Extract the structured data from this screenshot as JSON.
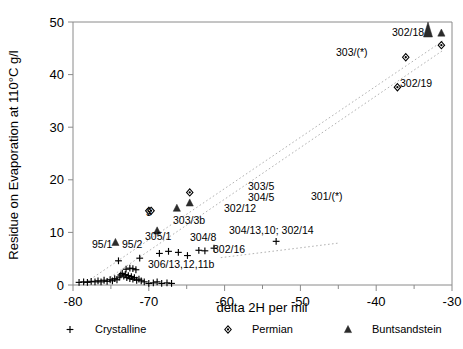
{
  "chart_data": {
    "type": "scatter",
    "title": "",
    "xlabel": "delta 2H  per mil",
    "ylabel": "Residue on Evaporation at 110°C  g/l",
    "xlim": [
      -80,
      -30
    ],
    "ylim": [
      0,
      50
    ],
    "xticks": [
      -80,
      -70,
      -60,
      -50,
      -40,
      -30
    ],
    "yticks": [
      0,
      10,
      20,
      30,
      40,
      50
    ],
    "xtick_labels": [
      "-80",
      "-70",
      "-60",
      "-50",
      "-40",
      "-30"
    ],
    "ytick_labels": [
      "0",
      "10",
      "20",
      "30",
      "40",
      "50"
    ],
    "xminor_step": 5,
    "grid": false,
    "legend_position": "below-axis",
    "legend": [
      {
        "label": "Crystalline",
        "marker": "plus"
      },
      {
        "label": "Permian",
        "marker": "diamond"
      },
      {
        "label": "Buntsandstein",
        "marker": "triangle"
      }
    ],
    "series": [
      {
        "name": "Crystalline",
        "marker": "plus",
        "points": [
          {
            "x": -79.2,
            "y": 0.5
          },
          {
            "x": -78.6,
            "y": 0.6
          },
          {
            "x": -78.1,
            "y": 0.5
          },
          {
            "x": -77.6,
            "y": 0.7
          },
          {
            "x": -77.1,
            "y": 0.6
          },
          {
            "x": -76.7,
            "y": 0.8
          },
          {
            "x": -76.3,
            "y": 0.6
          },
          {
            "x": -75.9,
            "y": 0.9
          },
          {
            "x": -75.5,
            "y": 0.7
          },
          {
            "x": -75.1,
            "y": 1.0
          },
          {
            "x": -74.8,
            "y": 0.8
          },
          {
            "x": -74.5,
            "y": 1.2
          },
          {
            "x": -74.2,
            "y": 1.0
          },
          {
            "x": -73.9,
            "y": 1.5
          },
          {
            "x": -73.7,
            "y": 1.9
          },
          {
            "x": -73.5,
            "y": 2.2
          },
          {
            "x": -73.3,
            "y": 1.7
          },
          {
            "x": -73.1,
            "y": 2.0
          },
          {
            "x": -72.9,
            "y": 1.4
          },
          {
            "x": -72.7,
            "y": 1.8
          },
          {
            "x": -72.5,
            "y": 1.2
          },
          {
            "x": -72.3,
            "y": 1.6
          },
          {
            "x": -72.1,
            "y": 1.1
          },
          {
            "x": -71.9,
            "y": 1.4
          },
          {
            "x": -71.6,
            "y": 0.9
          },
          {
            "x": -71.3,
            "y": 1.1
          },
          {
            "x": -71.0,
            "y": 0.8
          },
          {
            "x": -70.6,
            "y": 0.6
          },
          {
            "x": -70.0,
            "y": 0.3
          },
          {
            "x": -69.4,
            "y": 0.4
          },
          {
            "x": -68.9,
            "y": 0.6
          },
          {
            "x": -68.3,
            "y": 0.3
          },
          {
            "x": -67.6,
            "y": 0.4
          },
          {
            "x": -67.0,
            "y": 0.3
          },
          {
            "x": -73.0,
            "y": 3.0
          },
          {
            "x": -72.5,
            "y": 3.2
          },
          {
            "x": -72.1,
            "y": 3.1
          },
          {
            "x": -71.7,
            "y": 2.9
          },
          {
            "x": -74.0,
            "y": 4.6
          },
          {
            "x": -71.2,
            "y": 5.1
          },
          {
            "x": -68.6,
            "y": 6.0
          },
          {
            "x": -67.4,
            "y": 6.4
          },
          {
            "x": -66.1,
            "y": 6.2
          },
          {
            "x": -64.9,
            "y": 5.6
          },
          {
            "x": -63.4,
            "y": 6.6
          },
          {
            "x": -62.6,
            "y": 6.5
          },
          {
            "x": -61.4,
            "y": 7.0
          },
          {
            "x": -53.2,
            "y": 8.3
          }
        ]
      },
      {
        "name": "Permian",
        "marker": "diamond",
        "points": [
          {
            "x": -64.6,
            "y": 17.6
          },
          {
            "x": -70.0,
            "y": 14.1
          },
          {
            "x": -69.7,
            "y": 14.1
          },
          {
            "x": -36.1,
            "y": 43.3
          },
          {
            "x": -37.2,
            "y": 37.6
          },
          {
            "x": -31.4,
            "y": 45.6
          }
        ]
      },
      {
        "name": "Buntsandstein",
        "marker": "triangle",
        "points": [
          {
            "x": -64.6,
            "y": 15.6
          },
          {
            "x": -66.3,
            "y": 14.6
          },
          {
            "x": -68.9,
            "y": 10.3
          },
          {
            "x": -74.4,
            "y": 8.1
          },
          {
            "x": -31.4,
            "y": 47.9
          }
        ]
      }
    ],
    "trend_lines": [
      {
        "name": "upper-trend",
        "x1": -78.6,
        "y1": 0.2,
        "x2": -31.2,
        "y2": 46.4,
        "style": "dotted"
      },
      {
        "name": "lower-trend",
        "x1": -76.4,
        "y1": 0.2,
        "x2": -31.2,
        "y2": 44.6,
        "style": "dotted"
      },
      {
        "name": "301-branch",
        "x1": -60.5,
        "y1": 5.2,
        "x2": -44.8,
        "y2": 8.0,
        "style": "dotted"
      }
    ],
    "annotations": [
      {
        "text": "302/18",
        "x_px": 392,
        "y_px": 36,
        "anchor": "start"
      },
      {
        "text": "303/(*)",
        "x_px": 336,
        "y_px": 56,
        "anchor": "start"
      },
      {
        "text": "302/19",
        "x_px": 400,
        "y_px": 87,
        "anchor": "start"
      },
      {
        "text": "303/5",
        "x_px": 248,
        "y_px": 190,
        "anchor": "start"
      },
      {
        "text": "304/5",
        "x_px": 248,
        "y_px": 201,
        "anchor": "start"
      },
      {
        "text": "302/12",
        "x_px": 224,
        "y_px": 212,
        "anchor": "start"
      },
      {
        "text": "301/(*)",
        "x_px": 311,
        "y_px": 200,
        "anchor": "start"
      },
      {
        "text": "3",
        "x_px": 146,
        "y_px": 216,
        "anchor": "start"
      },
      {
        "text": "303/3b",
        "x_px": 173,
        "y_px": 224,
        "anchor": "start"
      },
      {
        "text": "304/13,10; 302/14",
        "x_px": 229,
        "y_px": 234,
        "anchor": "start"
      },
      {
        "text": "305/1",
        "x_px": 145,
        "y_px": 240,
        "anchor": "start"
      },
      {
        "text": "304/8",
        "x_px": 190,
        "y_px": 241,
        "anchor": "start"
      },
      {
        "text": "95/1",
        "x_px": 92,
        "y_px": 248,
        "anchor": "start"
      },
      {
        "text": "95/2",
        "x_px": 122,
        "y_px": 248,
        "anchor": "start"
      },
      {
        "text": "302/16",
        "x_px": 213,
        "y_px": 253,
        "anchor": "start"
      },
      {
        "text": "306/13,12,11b",
        "x_px": 148,
        "y_px": 268,
        "anchor": "start"
      }
    ]
  }
}
